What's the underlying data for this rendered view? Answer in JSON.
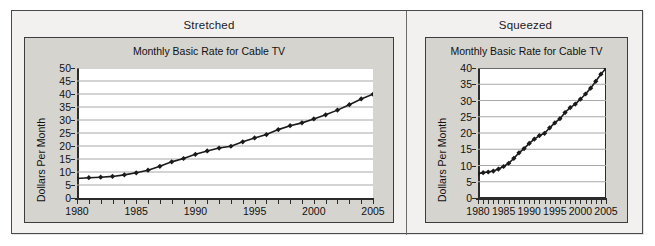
{
  "figure": {
    "background": "#f2f1ef",
    "card_fill": "#d6d4cf",
    "plot_fill": "#ffffff",
    "line_color": "#1a1a1a",
    "grid_color": "#a8a8a8"
  },
  "panels": [
    {
      "key": "stretched",
      "panel_label": "Stretched",
      "chart_data": {
        "type": "line",
        "title": "Monthly Basic Rate for Cable TV",
        "xlabel": "",
        "ylabel": "Dollars Per Month",
        "xlim": [
          1980,
          2005
        ],
        "ylim": [
          0,
          50
        ],
        "ytick_step": 5,
        "yticks": [
          0,
          5,
          10,
          15,
          20,
          25,
          30,
          35,
          40,
          45,
          50
        ],
        "ytick_labels": [
          "0",
          "5",
          "10",
          "15",
          "20",
          "25",
          "30",
          "35",
          "40",
          "45",
          "50"
        ],
        "xticks": [
          1980,
          1981,
          1982,
          1983,
          1984,
          1985,
          1986,
          1987,
          1988,
          1989,
          1990,
          1991,
          1992,
          1993,
          1994,
          1995,
          1996,
          1997,
          1998,
          1999,
          2000,
          2001,
          2002,
          2003,
          2004,
          2005
        ],
        "xtick_labels_shown": [
          "1980",
          "1985",
          "1990",
          "1995",
          "2000",
          "2005"
        ],
        "xtick_labels_at": [
          1980,
          1985,
          1990,
          1995,
          2000,
          2005
        ],
        "grid": "horizontal",
        "legend": "none",
        "marker": "diamond",
        "x": [
          1980,
          1981,
          1982,
          1983,
          1984,
          1985,
          1986,
          1987,
          1988,
          1989,
          1990,
          1991,
          1992,
          1993,
          1994,
          1995,
          1996,
          1997,
          1998,
          1999,
          2000,
          2001,
          2002,
          2003,
          2004,
          2005
        ],
        "values": [
          7.5,
          7.8,
          8.0,
          8.3,
          8.9,
          9.7,
          10.7,
          12.2,
          13.9,
          15.2,
          16.8,
          18.1,
          19.2,
          19.9,
          21.6,
          23.1,
          24.4,
          26.3,
          27.8,
          28.9,
          30.4,
          32.0,
          33.8,
          35.9,
          38.1,
          39.9
        ],
        "series_name": "Monthly basic rate"
      }
    },
    {
      "key": "squeezed",
      "panel_label": "Squeezed",
      "chart_data": {
        "type": "line",
        "title": "Monthly Basic Rate for Cable TV",
        "xlabel": "",
        "ylabel": "Dollars Per Month",
        "xlim": [
          1980,
          2005
        ],
        "ylim": [
          0,
          40
        ],
        "ytick_step": 5,
        "yticks": [
          0,
          5,
          10,
          15,
          20,
          25,
          30,
          35,
          40
        ],
        "ytick_labels": [
          "0",
          "5",
          "10",
          "15",
          "20",
          "25",
          "30",
          "35",
          "40"
        ],
        "xticks": [
          1980,
          1981,
          1982,
          1983,
          1984,
          1985,
          1986,
          1987,
          1988,
          1989,
          1990,
          1991,
          1992,
          1993,
          1994,
          1995,
          1996,
          1997,
          1998,
          1999,
          2000,
          2001,
          2002,
          2003,
          2004,
          2005
        ],
        "xtick_labels_shown": [
          "1980",
          "1985",
          "1990",
          "1995",
          "2000",
          "2005"
        ],
        "xtick_labels_at": [
          1980,
          1985,
          1990,
          1995,
          2000,
          2005
        ],
        "grid": "horizontal",
        "legend": "none",
        "marker": "diamond",
        "x": [
          1980,
          1981,
          1982,
          1983,
          1984,
          1985,
          1986,
          1987,
          1988,
          1989,
          1990,
          1991,
          1992,
          1993,
          1994,
          1995,
          1996,
          1997,
          1998,
          1999,
          2000,
          2001,
          2002,
          2003,
          2004,
          2005
        ],
        "values": [
          7.5,
          7.8,
          8.0,
          8.3,
          8.9,
          9.7,
          10.7,
          12.2,
          13.9,
          15.2,
          16.8,
          18.1,
          19.2,
          19.9,
          21.6,
          23.1,
          24.4,
          26.3,
          27.8,
          28.9,
          30.4,
          32.0,
          33.8,
          35.9,
          38.1,
          39.9
        ],
        "series_name": "Monthly basic rate"
      }
    }
  ]
}
